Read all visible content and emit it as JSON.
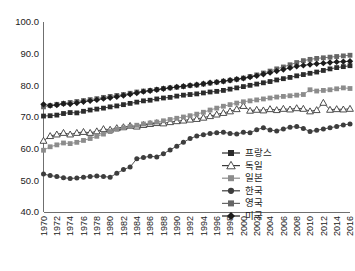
{
  "chart_data": {
    "type": "line",
    "title": "",
    "subtitle": "",
    "xlabel": "",
    "ylabel": "",
    "xlim": [
      1970,
      2016
    ],
    "ylim": [
      40.0,
      100.0
    ],
    "grid": false,
    "legend_position": "inside-bottom-right",
    "x": [
      1970,
      1971,
      1972,
      1973,
      1974,
      1975,
      1976,
      1977,
      1978,
      1979,
      1980,
      1981,
      1982,
      1983,
      1984,
      1985,
      1986,
      1987,
      1988,
      1989,
      1990,
      1991,
      1992,
      1993,
      1994,
      1995,
      1996,
      1997,
      1998,
      1999,
      2000,
      2001,
      2002,
      2003,
      2004,
      2005,
      2006,
      2007,
      2008,
      2009,
      2010,
      2011,
      2012,
      2013,
      2014,
      2015,
      2016
    ],
    "xtick_labels": [
      "1970",
      "1972",
      "1974",
      "1976",
      "1978",
      "1980",
      "1982",
      "1984",
      "1986",
      "1988",
      "1990",
      "1992",
      "1994",
      "1996",
      "1998",
      "2000",
      "2002",
      "2004",
      "2006",
      "2008",
      "2010",
      "2012",
      "2014",
      "2016"
    ],
    "ytick_labels": [
      "40.0",
      "50.0",
      "60.0",
      "70.0",
      "80.0",
      "90.0",
      "100.0"
    ],
    "ytick_values": [
      40.0,
      50.0,
      60.0,
      70.0,
      80.0,
      90.0,
      100.0
    ],
    "series": [
      {
        "name": "프랑스",
        "marker": "filled-square",
        "color": "#2b2b2b",
        "values": [
          70.3,
          70.4,
          70.6,
          71.1,
          71.4,
          71.3,
          71.8,
          72.2,
          72.5,
          72.8,
          73.2,
          73.5,
          73.9,
          74.3,
          74.7,
          75.1,
          75.3,
          75.7,
          76.0,
          76.2,
          76.6,
          76.9,
          77.1,
          77.3,
          77.6,
          77.9,
          78.1,
          78.4,
          78.8,
          79.2,
          79.6,
          80.0,
          80.4,
          80.8,
          81.2,
          81.7,
          82.1,
          82.5,
          83.0,
          83.4,
          83.8,
          84.2,
          84.7,
          85.2,
          85.6,
          85.9,
          86.2
        ]
      },
      {
        "name": "독일",
        "marker": "open-triangle",
        "color": "#3a3a3a",
        "values": [
          62.5,
          64.0,
          64.5,
          65.0,
          64.5,
          65.0,
          65.3,
          65.0,
          65.5,
          66.2,
          66.0,
          66.5,
          66.8,
          67.2,
          67.0,
          67.5,
          67.8,
          68.1,
          68.0,
          68.4,
          68.7,
          68.9,
          69.2,
          69.4,
          69.8,
          70.3,
          70.8,
          71.3,
          71.8,
          72.5,
          73.5,
          72.0,
          72.3,
          72.1,
          72.5,
          72.2,
          72.6,
          72.4,
          72.8,
          72.6,
          71.8,
          72.2,
          74.5,
          72.3,
          72.5,
          72.4,
          72.6
        ]
      },
      {
        "name": "일본",
        "marker": "filled-square-gray",
        "color": "#8c8c8c",
        "values": [
          59.5,
          60.6,
          61.2,
          61.8,
          61.6,
          62.0,
          62.6,
          63.2,
          63.9,
          64.6,
          65.4,
          66.1,
          66.6,
          67.0,
          67.4,
          67.8,
          68.1,
          68.4,
          68.8,
          69.2,
          69.6,
          70.0,
          70.4,
          70.9,
          71.5,
          72.2,
          72.8,
          73.4,
          73.9,
          74.4,
          74.8,
          75.1,
          75.4,
          75.7,
          76.0,
          76.3,
          76.5,
          76.7,
          76.9,
          77.1,
          78.6,
          78.2,
          78.4,
          78.6,
          78.9,
          79.2,
          79.0
        ]
      },
      {
        "name": "한국",
        "marker": "filled-circle",
        "color": "#3d3d3d",
        "values": [
          52.0,
          51.5,
          51.2,
          50.8,
          50.6,
          50.7,
          51.0,
          51.2,
          51.4,
          51.2,
          51.0,
          52.2,
          53.4,
          54.2,
          56.8,
          57.2,
          57.6,
          57.4,
          58.4,
          59.6,
          60.8,
          62.0,
          63.2,
          64.0,
          64.4,
          64.8,
          65.0,
          65.2,
          64.8,
          64.6,
          65.2,
          65.0,
          66.0,
          66.6,
          65.9,
          65.6,
          66.2,
          66.8,
          67.0,
          66.4,
          65.4,
          65.8,
          66.2,
          66.6,
          67.0,
          67.5,
          67.8
        ]
      },
      {
        "name": "영국",
        "marker": "filled-square-midgray",
        "color": "#666666",
        "values": [
          73.2,
          73.6,
          74.0,
          74.3,
          74.6,
          74.9,
          75.2,
          75.5,
          75.8,
          76.2,
          76.5,
          76.8,
          77.1,
          77.5,
          77.9,
          78.2,
          78.4,
          78.7,
          79.0,
          79.2,
          79.4,
          79.6,
          79.9,
          80.1,
          80.4,
          80.7,
          81.0,
          81.3,
          81.6,
          81.9,
          82.3,
          82.8,
          83.3,
          83.9,
          84.5,
          85.2,
          85.8,
          86.5,
          87.2,
          87.8,
          88.2,
          88.5,
          88.7,
          88.9,
          89.1,
          89.3,
          89.5
        ]
      },
      {
        "name": "미국",
        "marker": "filled-diamond",
        "color": "#1c1c1c",
        "values": [
          74.0,
          73.6,
          73.8,
          74.2,
          74.1,
          74.4,
          74.8,
          75.1,
          75.4,
          75.8,
          76.1,
          76.4,
          76.8,
          77.2,
          77.6,
          78.0,
          78.3,
          78.6,
          78.9,
          79.2,
          79.5,
          79.7,
          80.0,
          80.2,
          80.5,
          80.8,
          81.0,
          81.3,
          81.6,
          81.9,
          82.2,
          82.6,
          83.0,
          83.5,
          84.0,
          84.5,
          85.0,
          85.5,
          86.0,
          86.3,
          86.6,
          86.8,
          87.0,
          87.2,
          87.4,
          87.5,
          87.6
        ]
      }
    ]
  },
  "legend": {
    "items": [
      {
        "label": "프랑스",
        "marker": "filled-square",
        "color": "#2b2b2b"
      },
      {
        "label": "독일",
        "marker": "open-triangle",
        "color": "#3a3a3a"
      },
      {
        "label": "일본",
        "marker": "filled-square-gray",
        "color": "#8c8c8c"
      },
      {
        "label": "한국",
        "marker": "filled-circle",
        "color": "#3d3d3d"
      },
      {
        "label": "영국",
        "marker": "filled-square-midgray",
        "color": "#666666"
      },
      {
        "label": "미국",
        "marker": "filled-diamond",
        "color": "#1c1c1c"
      }
    ]
  },
  "axes": {
    "axis_color": "#6f6f6f",
    "tick_text_color": "#222222"
  }
}
